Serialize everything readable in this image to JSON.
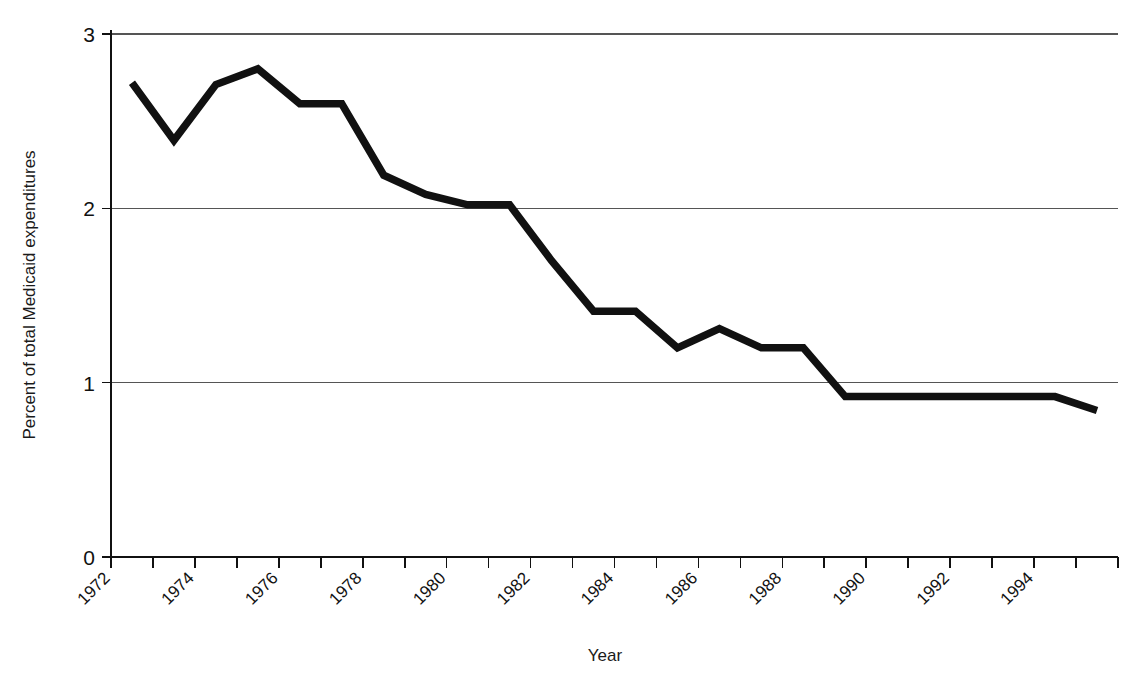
{
  "chart_data": {
    "type": "line",
    "title": "",
    "xlabel": "Year",
    "ylabel": "Percent of total Medicaid expenditures",
    "xlim": [
      1972,
      1996
    ],
    "ylim": [
      0,
      3
    ],
    "y_ticks": [
      "0",
      "1",
      "2",
      "3"
    ],
    "y_tick_values": [
      0,
      1,
      2,
      3
    ],
    "grid": "horizontal",
    "legend": "none",
    "x_tick_values": [
      1972,
      1973,
      1974,
      1975,
      1976,
      1977,
      1978,
      1979,
      1980,
      1981,
      1982,
      1983,
      1984,
      1985,
      1986,
      1987,
      1988,
      1989,
      1990,
      1991,
      1992,
      1993,
      1994,
      1995,
      1996
    ],
    "x_tick_labels": [
      "1972",
      "",
      "1974",
      "",
      "1976",
      "",
      "1978",
      "",
      "1980",
      "",
      "1982",
      "",
      "1984",
      "",
      "1986",
      "",
      "1988",
      "",
      "1990",
      "",
      "1992",
      "",
      "1994",
      "",
      ""
    ],
    "x": [
      1972.5,
      1973.5,
      1974.5,
      1975.5,
      1976.5,
      1977.5,
      1978.5,
      1979.5,
      1980.5,
      1981.5,
      1982.5,
      1983.5,
      1984.5,
      1985.5,
      1986.5,
      1987.5,
      1988.5,
      1989.5,
      1990.5,
      1991.5,
      1992.5,
      1993.5,
      1994.5,
      1995.5
    ],
    "series": [
      {
        "name": "Percent of total Medicaid expenditures",
        "color": "#111111",
        "values": [
          2.72,
          2.39,
          2.71,
          2.8,
          2.6,
          2.6,
          2.19,
          2.08,
          2.02,
          2.02,
          1.7,
          1.41,
          1.41,
          1.2,
          1.31,
          1.2,
          1.2,
          0.92,
          0.92,
          0.92,
          0.92,
          0.92,
          0.92,
          0.84
        ]
      }
    ]
  },
  "figure": {
    "x_axis_title": "Year",
    "y_axis_title": "Percent of total Medicaid expenditures"
  }
}
